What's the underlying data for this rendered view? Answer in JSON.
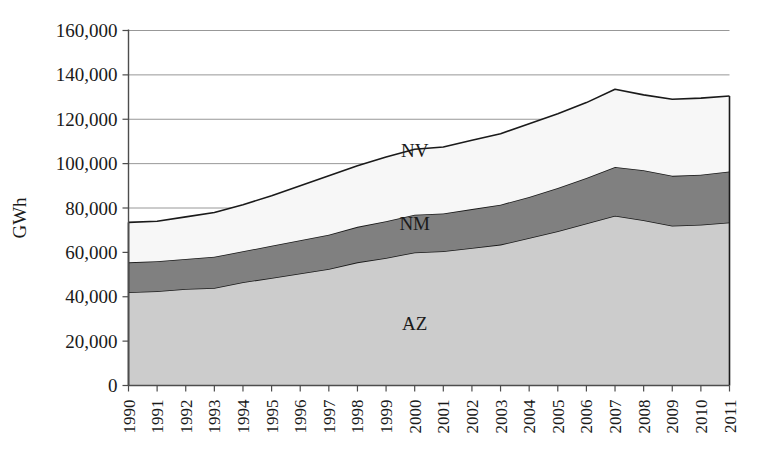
{
  "chart_data": {
    "type": "area",
    "stacked": true,
    "title": "",
    "xlabel": "",
    "ylabel": "GWh",
    "ylim": [
      0,
      160000
    ],
    "ytick_labels": [
      "0",
      "20,000",
      "40,000",
      "60,000",
      "80,000",
      "100,000",
      "120,000",
      "140,000",
      "160,000"
    ],
    "yticks": [
      0,
      20000,
      40000,
      60000,
      80000,
      100000,
      120000,
      140000,
      160000
    ],
    "grid": true,
    "grid_axis": "y",
    "legend_position": "inline-annotations",
    "categories": [
      1990,
      1991,
      1992,
      1993,
      1994,
      1995,
      1996,
      1997,
      1998,
      1999,
      2000,
      2001,
      2002,
      2003,
      2004,
      2005,
      2006,
      2007,
      2008,
      2009,
      2010,
      2011
    ],
    "xtick_labels": [
      "1990",
      "1991",
      "1992",
      "1993",
      "1994",
      "1995",
      "1996",
      "1997",
      "1998",
      "1999",
      "2000",
      "2001",
      "2002",
      "2003",
      "2004",
      "2005",
      "2006",
      "2007",
      "2008",
      "2009",
      "2010",
      "2011"
    ],
    "series": [
      {
        "name": "AZ",
        "label": "AZ",
        "color": "#cccccc",
        "values": [
          42000,
          42500,
          43500,
          44000,
          46500,
          48500,
          50500,
          52500,
          55500,
          57500,
          60000,
          60500,
          62000,
          63500,
          66500,
          69500,
          73000,
          76500,
          74500,
          72000,
          72500,
          73500
        ]
      },
      {
        "name": "NM",
        "label": "NM",
        "color": "#808080",
        "values": [
          13500,
          13500,
          13500,
          14000,
          14000,
          14500,
          15000,
          15500,
          16000,
          16500,
          17000,
          17000,
          17500,
          18000,
          18500,
          19500,
          20500,
          22000,
          22500,
          22500,
          22500,
          23000
        ]
      },
      {
        "name": "NV",
        "label": "NV",
        "color": "#f7f7f7",
        "values": [
          18000,
          18000,
          19000,
          20000,
          21000,
          22500,
          24500,
          26500,
          27500,
          29000,
          29500,
          30000,
          31000,
          32000,
          33000,
          33500,
          34000,
          35000,
          34000,
          34500,
          34500,
          34000
        ]
      }
    ],
    "series_annotations": [
      {
        "name": "NV",
        "text": "NV",
        "x_year": 2000,
        "y_value": 103000
      },
      {
        "name": "NM",
        "text": "NM",
        "x_year": 2000,
        "y_value": 70000
      },
      {
        "name": "AZ",
        "text": "AZ",
        "x_year": 2000,
        "y_value": 25000
      }
    ]
  }
}
